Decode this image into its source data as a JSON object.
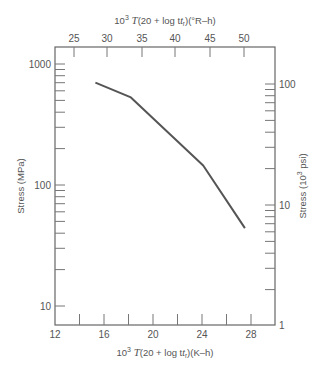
{
  "chart_data": {
    "type": "line",
    "title": "",
    "xlabel": "10^3 T(20 + log t_r)(K–h)",
    "x2label": "10^3 T(20 + log t_r)(°R–h)",
    "ylabel": "Stress (MPa)",
    "y2label": "Stress (10^3 psi)",
    "xlim": [
      12,
      30
    ],
    "x2lim": [
      22.2,
      54
    ],
    "ylim": [
      7,
      1500
    ],
    "yscale": "log",
    "y2scale": "log",
    "grid": false,
    "legend": null,
    "x_ticks": [
      "12",
      "16",
      "20",
      "24",
      "28"
    ],
    "x2_ticks": [
      "25",
      "30",
      "35",
      "40",
      "45",
      "50"
    ],
    "y_ticks": [
      "10",
      "100",
      "1000"
    ],
    "y2_ticks": [
      "1",
      "10",
      "100"
    ],
    "series": [
      {
        "name": "Stress vs Larson-Miller parameter",
        "x": [
          15.3,
          18.2,
          24.1,
          27.5
        ],
        "y": [
          700,
          530,
          145,
          44
        ]
      }
    ]
  },
  "labels": {
    "top_axis_title": "(20 + log t",
    "top_axis_units": ")(°R–h)",
    "bottom_axis_units": ")(K–h)",
    "ten_cubed": "10",
    "exp3": "3",
    "T": "T",
    "t": "t",
    "r": "r",
    "left_axis_title": "Stress (MPa)",
    "right_axis_title_a": "Stress (10",
    "right_axis_title_b": " psi)"
  }
}
